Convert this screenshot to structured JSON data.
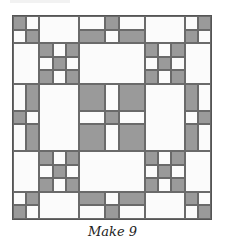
{
  "figure": {
    "caption": "Make 9",
    "grid_units": 15,
    "colors": {
      "dark": "#9a9a9a",
      "light": "#fbfbfb",
      "line": "#6a6a6a"
    },
    "patches": [
      [
        0,
        0,
        1,
        1,
        "d"
      ],
      [
        1,
        0,
        1,
        1,
        "l"
      ],
      [
        0,
        1,
        1,
        1,
        "l"
      ],
      [
        1,
        1,
        1,
        1,
        "d"
      ],
      [
        2,
        0,
        3,
        2,
        "l"
      ],
      [
        5,
        0,
        2,
        1,
        "l"
      ],
      [
        5,
        1,
        2,
        1,
        "d"
      ],
      [
        7,
        0,
        1,
        1,
        "d"
      ],
      [
        7,
        1,
        1,
        1,
        "l"
      ],
      [
        8,
        0,
        2,
        1,
        "l"
      ],
      [
        8,
        1,
        2,
        1,
        "d"
      ],
      [
        10,
        0,
        3,
        2,
        "l"
      ],
      [
        13,
        0,
        1,
        1,
        "l"
      ],
      [
        14,
        0,
        1,
        1,
        "d"
      ],
      [
        13,
        1,
        1,
        1,
        "d"
      ],
      [
        14,
        1,
        1,
        1,
        "l"
      ],
      [
        0,
        2,
        2,
        3,
        "l"
      ],
      [
        2,
        2,
        1,
        1,
        "d"
      ],
      [
        3,
        2,
        1,
        1,
        "l"
      ],
      [
        4,
        2,
        1,
        1,
        "d"
      ],
      [
        2,
        3,
        1,
        1,
        "l"
      ],
      [
        3,
        3,
        1,
        1,
        "d"
      ],
      [
        4,
        3,
        1,
        1,
        "l"
      ],
      [
        2,
        4,
        1,
        1,
        "d"
      ],
      [
        3,
        4,
        1,
        1,
        "l"
      ],
      [
        4,
        4,
        1,
        1,
        "d"
      ],
      [
        5,
        2,
        5,
        3,
        "l"
      ],
      [
        10,
        2,
        1,
        1,
        "d"
      ],
      [
        11,
        2,
        1,
        1,
        "l"
      ],
      [
        12,
        2,
        1,
        1,
        "d"
      ],
      [
        10,
        3,
        1,
        1,
        "l"
      ],
      [
        11,
        3,
        1,
        1,
        "d"
      ],
      [
        12,
        3,
        1,
        1,
        "l"
      ],
      [
        10,
        4,
        1,
        1,
        "d"
      ],
      [
        11,
        4,
        1,
        1,
        "l"
      ],
      [
        12,
        4,
        1,
        1,
        "d"
      ],
      [
        13,
        2,
        2,
        3,
        "l"
      ],
      [
        0,
        5,
        1,
        2,
        "l"
      ],
      [
        1,
        5,
        1,
        2,
        "d"
      ],
      [
        0,
        7,
        1,
        1,
        "d"
      ],
      [
        1,
        7,
        1,
        1,
        "l"
      ],
      [
        0,
        8,
        1,
        2,
        "l"
      ],
      [
        1,
        8,
        1,
        2,
        "d"
      ],
      [
        2,
        5,
        3,
        5,
        "l"
      ],
      [
        5,
        5,
        2,
        2,
        "d"
      ],
      [
        7,
        5,
        1,
        2,
        "l"
      ],
      [
        8,
        5,
        2,
        2,
        "d"
      ],
      [
        5,
        7,
        2,
        1,
        "l"
      ],
      [
        7,
        7,
        1,
        1,
        "d"
      ],
      [
        8,
        7,
        2,
        1,
        "l"
      ],
      [
        5,
        8,
        2,
        2,
        "d"
      ],
      [
        7,
        8,
        1,
        2,
        "l"
      ],
      [
        8,
        8,
        2,
        2,
        "d"
      ],
      [
        10,
        5,
        3,
        5,
        "l"
      ],
      [
        13,
        5,
        1,
        2,
        "d"
      ],
      [
        14,
        5,
        1,
        2,
        "l"
      ],
      [
        13,
        7,
        1,
        1,
        "l"
      ],
      [
        14,
        7,
        1,
        1,
        "d"
      ],
      [
        13,
        8,
        1,
        2,
        "d"
      ],
      [
        14,
        8,
        1,
        2,
        "l"
      ],
      [
        0,
        10,
        2,
        3,
        "l"
      ],
      [
        2,
        10,
        1,
        1,
        "d"
      ],
      [
        3,
        10,
        1,
        1,
        "l"
      ],
      [
        4,
        10,
        1,
        1,
        "d"
      ],
      [
        2,
        11,
        1,
        1,
        "l"
      ],
      [
        3,
        11,
        1,
        1,
        "d"
      ],
      [
        4,
        11,
        1,
        1,
        "l"
      ],
      [
        2,
        12,
        1,
        1,
        "d"
      ],
      [
        3,
        12,
        1,
        1,
        "l"
      ],
      [
        4,
        12,
        1,
        1,
        "d"
      ],
      [
        5,
        10,
        5,
        3,
        "l"
      ],
      [
        10,
        10,
        1,
        1,
        "d"
      ],
      [
        11,
        10,
        1,
        1,
        "l"
      ],
      [
        12,
        10,
        1,
        1,
        "d"
      ],
      [
        10,
        11,
        1,
        1,
        "l"
      ],
      [
        11,
        11,
        1,
        1,
        "d"
      ],
      [
        12,
        11,
        1,
        1,
        "l"
      ],
      [
        10,
        12,
        1,
        1,
        "d"
      ],
      [
        11,
        12,
        1,
        1,
        "l"
      ],
      [
        12,
        12,
        1,
        1,
        "d"
      ],
      [
        13,
        10,
        2,
        3,
        "l"
      ],
      [
        0,
        13,
        1,
        1,
        "l"
      ],
      [
        1,
        13,
        1,
        1,
        "d"
      ],
      [
        0,
        14,
        1,
        1,
        "d"
      ],
      [
        1,
        14,
        1,
        1,
        "l"
      ],
      [
        2,
        13,
        3,
        2,
        "l"
      ],
      [
        5,
        13,
        2,
        1,
        "d"
      ],
      [
        5,
        14,
        2,
        1,
        "l"
      ],
      [
        7,
        13,
        1,
        1,
        "l"
      ],
      [
        7,
        14,
        1,
        1,
        "d"
      ],
      [
        8,
        13,
        2,
        1,
        "d"
      ],
      [
        8,
        14,
        2,
        1,
        "l"
      ],
      [
        10,
        13,
        3,
        2,
        "l"
      ],
      [
        13,
        13,
        1,
        1,
        "d"
      ],
      [
        14,
        13,
        1,
        1,
        "l"
      ],
      [
        13,
        14,
        1,
        1,
        "l"
      ],
      [
        14,
        14,
        1,
        1,
        "d"
      ]
    ]
  }
}
